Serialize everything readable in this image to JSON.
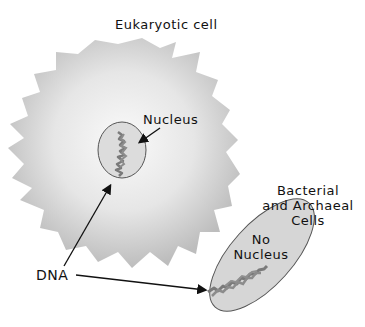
{
  "title": "Eukaryotic cell",
  "labels": {
    "nucleus": "Nucleus",
    "prokaryote_title_line1": "Bacterial",
    "prokaryote_title_line2": "and Archaeal",
    "prokaryote_title_line3": "Cells",
    "no_nucleus_line1": "No",
    "no_nucleus_line2": "Nucleus",
    "dna": "DNA"
  },
  "colors": {
    "cell_fill": "#c8c8c8",
    "cell_center": "#f4f4f4",
    "nucleus_fill": "#dcdcdc",
    "dna": "#7a7a7a",
    "arrow": "#111111"
  }
}
